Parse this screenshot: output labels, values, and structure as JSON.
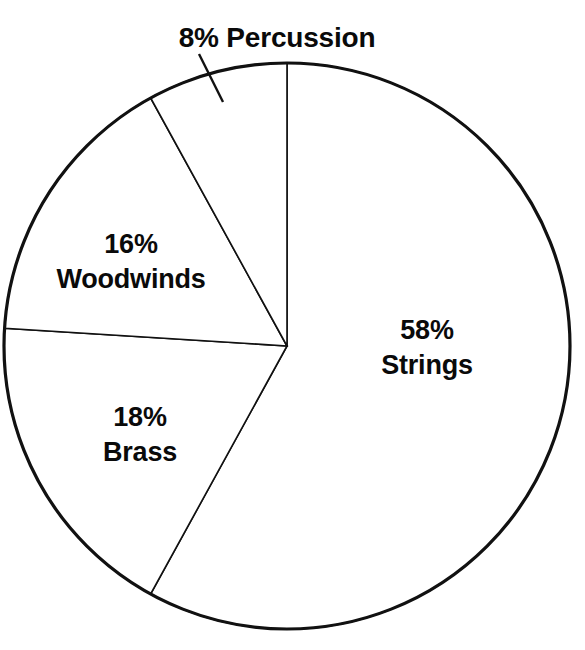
{
  "chart_data": {
    "type": "pie",
    "title": "",
    "subtitle": "",
    "xlabel": "",
    "ylabel": "",
    "legend_position": "none",
    "grid": false,
    "units": "percent",
    "total": 100,
    "start_angle_deg": 0,
    "direction": "clockwise",
    "categories": [
      "Strings",
      "Brass",
      "Woodwinds",
      "Percussion"
    ],
    "values": [
      58,
      18,
      16,
      8
    ],
    "slices": [
      {
        "name": "Strings",
        "value": 58,
        "percent_text": "58%",
        "label_text": "58% Strings",
        "color": "#ffffff",
        "stroke": "#111111",
        "label_placement": "inside",
        "start_angle_deg": 0,
        "sweep_angle_deg": 208.8
      },
      {
        "name": "Brass",
        "value": 18,
        "percent_text": "18%",
        "label_text": "18% Brass",
        "color": "#ffffff",
        "stroke": "#111111",
        "label_placement": "inside",
        "start_angle_deg": 208.8,
        "sweep_angle_deg": 64.8
      },
      {
        "name": "Woodwinds",
        "value": 16,
        "percent_text": "16%",
        "label_text": "16% Woodwinds",
        "color": "#ffffff",
        "stroke": "#111111",
        "label_placement": "inside",
        "start_angle_deg": 273.6,
        "sweep_angle_deg": 57.6
      },
      {
        "name": "Percussion",
        "value": 8,
        "percent_text": "8%",
        "label_text": "8% Percussion",
        "color": "#ffffff",
        "stroke": "#111111",
        "label_placement": "outside-callout",
        "start_angle_deg": 331.2,
        "sweep_angle_deg": 28.8
      }
    ]
  },
  "labels": {
    "percussion": "8% Percussion",
    "strings_pct": "58%",
    "strings_name": "Strings",
    "woodwinds_pct": "16%",
    "woodwinds_name": "Woodwinds",
    "brass_pct": "18%",
    "brass_name": "Brass"
  },
  "geometry": {
    "center_x": 287,
    "center_y": 346,
    "radius": 283
  },
  "colors": {
    "ink": "#111111",
    "background": "#ffffff",
    "text": "#0a0a0a"
  }
}
